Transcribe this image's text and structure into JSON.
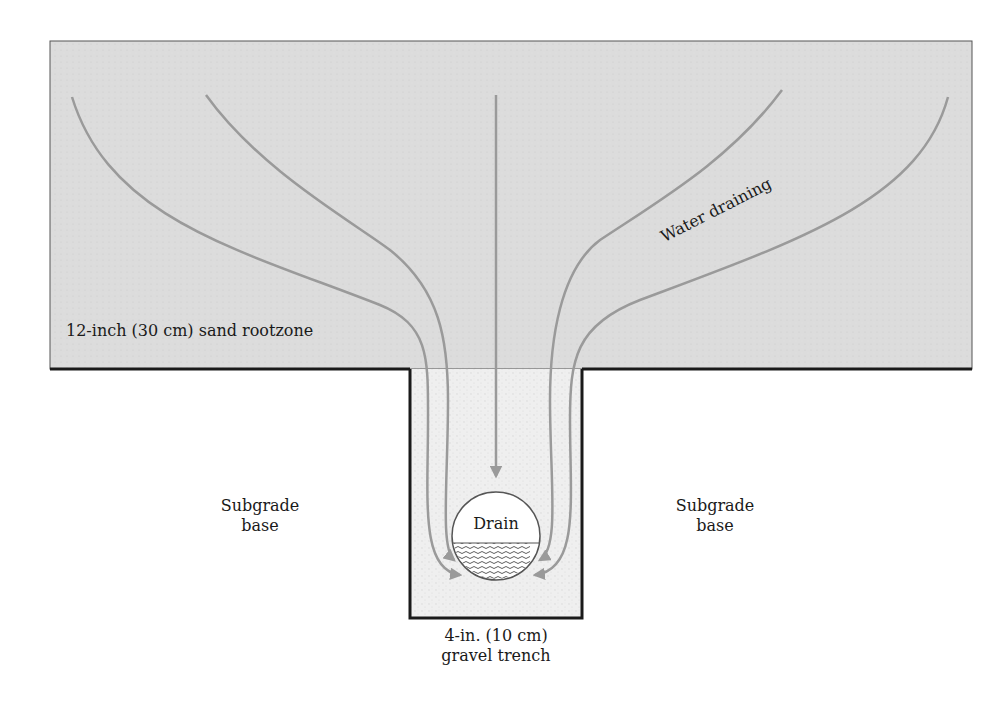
{
  "diagram": {
    "labels": {
      "rootzone": "12-inch (30 cm) sand rootzone",
      "water_draining": "Water draining",
      "subgrade_left_line1": "Subgrade",
      "subgrade_left_line2": "base",
      "subgrade_right_line1": "Subgrade",
      "subgrade_right_line2": "base",
      "drain": "Drain",
      "trench_line1": "4-in. (10 cm)",
      "trench_line2": "gravel trench"
    },
    "colors": {
      "rootzone_fill": "#dcdcdc",
      "trench_fill": "#eeeeee",
      "flow_line": "#9a9a9a",
      "border": "#1a1a1a",
      "background": "#ffffff"
    },
    "elements": [
      {
        "id": "rootzone-layer",
        "type": "rectangle"
      },
      {
        "id": "gravel-trench",
        "type": "rectangle"
      },
      {
        "id": "drain-pipe",
        "type": "circle",
        "note": "half filled with water"
      },
      {
        "id": "flow-arrows",
        "type": "curves",
        "count": 5
      }
    ]
  }
}
